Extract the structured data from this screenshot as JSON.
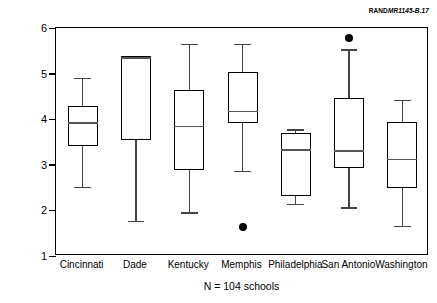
{
  "figure": {
    "id_prefix": "RAND",
    "id_suffix": "MR1145-B.17",
    "caption": "N = 104 schools"
  },
  "chart_data": {
    "type": "box",
    "title": "",
    "xlabel": "N = 104 schools",
    "ylabel": "Block scheduling for specific curricular purposes",
    "ylim": [
      1,
      6
    ],
    "yticks": [
      "1",
      "2",
      "3",
      "4",
      "5",
      "6"
    ],
    "grid": false,
    "legend": "none",
    "categories": [
      "Cincinnati",
      "Dade",
      "Kentucky",
      "Memphis",
      "Philadelphia",
      "San Antonio",
      "Washington"
    ],
    "boxes": [
      {
        "name": "Cincinnati",
        "whisker_low": 2.51,
        "q1": 3.42,
        "median": 3.93,
        "q3": 4.3,
        "whisker_high": 4.9,
        "outliers": []
      },
      {
        "name": "Dade",
        "whisker_low": 1.77,
        "q1": 3.55,
        "median": 5.36,
        "q3": 5.38,
        "whisker_high": 5.38,
        "outliers": []
      },
      {
        "name": "Kentucky",
        "whisker_low": 1.96,
        "q1": 2.88,
        "median": 3.86,
        "q3": 4.63,
        "whisker_high": 5.66,
        "outliers": []
      },
      {
        "name": "Memphis",
        "whisker_low": 2.87,
        "q1": 3.92,
        "median": 4.19,
        "q3": 5.04,
        "whisker_high": 5.66,
        "outliers": [
          1.63
        ]
      },
      {
        "name": "Philadelphia",
        "whisker_low": 2.15,
        "q1": 2.32,
        "median": 3.34,
        "q3": 3.69,
        "whisker_high": 3.78,
        "outliers": []
      },
      {
        "name": "San Antonio",
        "whisker_low": 2.07,
        "q1": 2.93,
        "median": 3.32,
        "q3": 4.47,
        "whisker_high": 5.53,
        "outliers": [
          5.78
        ]
      },
      {
        "name": "Washington",
        "whisker_low": 1.66,
        "q1": 2.49,
        "median": 3.13,
        "q3": 3.94,
        "whisker_high": 4.42,
        "outliers": []
      }
    ]
  }
}
